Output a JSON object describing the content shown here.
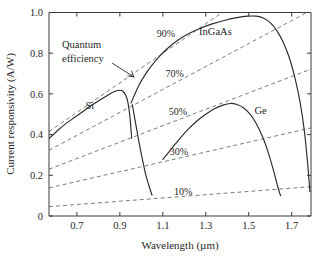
{
  "chart_data": {
    "type": "line",
    "title": "",
    "xlabel": "Wavelength (µm)",
    "ylabel": "Current responsivity (A/W)",
    "xlim": [
      0.57,
      1.79
    ],
    "ylim": [
      0,
      1.0
    ],
    "grid": false,
    "legend_position": "inline-annotations",
    "xticks": [
      "0.7",
      "0.9",
      "1.1",
      "1.3",
      "1.5",
      "1.7"
    ],
    "xtick_values": [
      0.7,
      0.9,
      1.1,
      1.3,
      1.5,
      1.7
    ],
    "yticks": [
      "0",
      "0.2",
      "0.4",
      "0.6",
      "0.8",
      "1.0"
    ],
    "ytick_values": [
      0,
      0.2,
      0.4,
      0.6,
      0.8,
      1.0
    ],
    "annotations": [
      {
        "id": "quantum-efficiency",
        "text_line1": "Quantum",
        "text_line2": "efficiency",
        "x": 0.7,
        "y": 0.82
      }
    ],
    "series": [
      {
        "name": "Si",
        "label": "Si",
        "label_x": 0.76,
        "label_y": 0.545,
        "points": [
          [
            0.57,
            0.38
          ],
          [
            0.61,
            0.42
          ],
          [
            0.65,
            0.455
          ],
          [
            0.69,
            0.485
          ],
          [
            0.73,
            0.515
          ],
          [
            0.77,
            0.545
          ],
          [
            0.81,
            0.572
          ],
          [
            0.845,
            0.595
          ],
          [
            0.875,
            0.612
          ],
          [
            0.9,
            0.618
          ],
          [
            0.915,
            0.612
          ],
          [
            0.928,
            0.592
          ],
          [
            0.938,
            0.555
          ],
          [
            0.946,
            0.495
          ],
          [
            0.951,
            0.435
          ],
          [
            0.955,
            0.382
          ]
        ]
      },
      {
        "name": "InGaAs",
        "label": "InGaAs",
        "label_x": 1.345,
        "label_y": 0.905,
        "points": [
          [
            0.958,
            0.548
          ],
          [
            0.975,
            0.445
          ],
          [
            0.99,
            0.358
          ],
          [
            1.005,
            0.278
          ],
          [
            1.02,
            0.205
          ],
          [
            1.035,
            0.15
          ],
          [
            1.048,
            0.108
          ],
          [
            1.048,
            0.108
          ],
          [
            1.035,
            0.15
          ]
        ],
        "points_main": [
          [
            0.952,
            0.555
          ],
          [
            0.97,
            0.6
          ],
          [
            0.99,
            0.645
          ],
          [
            1.015,
            0.69
          ],
          [
            1.045,
            0.735
          ],
          [
            1.08,
            0.78
          ],
          [
            1.12,
            0.822
          ],
          [
            1.165,
            0.86
          ],
          [
            1.215,
            0.893
          ],
          [
            1.27,
            0.92
          ],
          [
            1.33,
            0.944
          ],
          [
            1.39,
            0.962
          ],
          [
            1.445,
            0.975
          ],
          [
            1.495,
            0.982
          ],
          [
            1.535,
            0.982
          ],
          [
            1.57,
            0.972
          ],
          [
            1.6,
            0.95
          ],
          [
            1.63,
            0.912
          ],
          [
            1.66,
            0.855
          ],
          [
            1.69,
            0.775
          ],
          [
            1.715,
            0.68
          ],
          [
            1.74,
            0.555
          ],
          [
            1.76,
            0.41
          ],
          [
            1.775,
            0.25
          ],
          [
            1.785,
            0.12
          ]
        ]
      },
      {
        "name": "Ge",
        "label": "Ge",
        "label_x": 1.555,
        "label_y": 0.52,
        "points": [
          [
            1.1,
            0.278
          ],
          [
            1.14,
            0.33
          ],
          [
            1.18,
            0.382
          ],
          [
            1.22,
            0.428
          ],
          [
            1.26,
            0.468
          ],
          [
            1.3,
            0.5
          ],
          [
            1.34,
            0.527
          ],
          [
            1.38,
            0.545
          ],
          [
            1.415,
            0.553
          ],
          [
            1.445,
            0.548
          ],
          [
            1.475,
            0.532
          ],
          [
            1.505,
            0.502
          ],
          [
            1.535,
            0.455
          ],
          [
            1.565,
            0.388
          ],
          [
            1.59,
            0.315
          ],
          [
            1.615,
            0.225
          ],
          [
            1.635,
            0.145
          ],
          [
            1.648,
            0.1
          ]
        ]
      }
    ],
    "quantum_efficiency_lines": [
      {
        "label": "90%",
        "value": 90,
        "label_x": 1.115,
        "label_y": 0.895,
        "y_at_xmin": 0.415,
        "y_at_xmax": 1.3
      },
      {
        "label": "70%",
        "value": 70,
        "label_x": 1.155,
        "label_y": 0.7,
        "y_at_xmin": 0.323,
        "y_at_xmax": 1.011
      },
      {
        "label": "50%",
        "value": 50,
        "label_x": 1.17,
        "label_y": 0.512,
        "y_at_xmin": 0.23,
        "y_at_xmax": 0.722
      },
      {
        "label": "30%",
        "value": 30,
        "label_x": 1.175,
        "label_y": 0.318,
        "y_at_xmin": 0.138,
        "y_at_xmax": 0.433
      },
      {
        "label": "10%",
        "value": 10,
        "label_x": 1.195,
        "label_y": 0.122,
        "y_at_xmin": 0.046,
        "y_at_xmax": 0.144
      }
    ]
  }
}
